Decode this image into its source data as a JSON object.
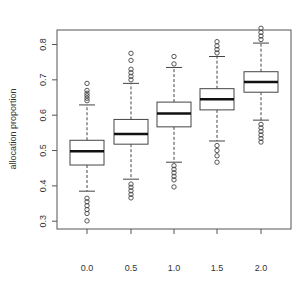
{
  "chart_data": {
    "type": "boxplot",
    "title": "",
    "xlabel": "",
    "ylabel": "allocation proportion",
    "categories": [
      "0.0",
      "0.5",
      "1.0",
      "1.5",
      "2.0"
    ],
    "ylim": [
      0.278,
      0.841
    ],
    "yticks": [
      0.3,
      0.4,
      0.5,
      0.6,
      0.7,
      0.8
    ],
    "ytick_labels": [
      "0.3",
      "0.4",
      "0.5",
      "0.6",
      "0.7",
      "0.8"
    ],
    "grid": false,
    "legend": null,
    "series": [
      {
        "name": "allocation proportion",
        "boxes": [
          {
            "category": "0.0",
            "whisker_low": 0.385,
            "q1": 0.459,
            "median": 0.498,
            "q3": 0.529,
            "whisker_high": 0.629,
            "outliers_high": [
              0.641,
              0.648,
              0.655,
              0.662,
              0.67,
              0.69
            ],
            "outliers_low": [
              0.301,
              0.322,
              0.333,
              0.344,
              0.355,
              0.365
            ]
          },
          {
            "category": "0.5",
            "whisker_low": 0.419,
            "q1": 0.518,
            "median": 0.547,
            "q3": 0.588,
            "whisker_high": 0.69,
            "outliers_high": [
              0.7,
              0.71,
              0.72,
              0.73,
              0.755,
              0.775
            ],
            "outliers_low": [
              0.366,
              0.376,
              0.386,
              0.396,
              0.405
            ]
          },
          {
            "category": "1.0",
            "whisker_low": 0.467,
            "q1": 0.567,
            "median": 0.605,
            "q3": 0.637,
            "whisker_high": 0.735,
            "outliers_high": [
              0.745,
              0.766
            ],
            "outliers_low": [
              0.397,
              0.417,
              0.427,
              0.437,
              0.447,
              0.457
            ]
          },
          {
            "category": "1.5",
            "whisker_low": 0.527,
            "q1": 0.615,
            "median": 0.645,
            "q3": 0.675,
            "whisker_high": 0.766,
            "outliers_high": [
              0.776,
              0.786,
              0.796,
              0.808
            ],
            "outliers_low": [
              0.467,
              0.485,
              0.5,
              0.514
            ]
          },
          {
            "category": "2.0",
            "whisker_low": 0.586,
            "q1": 0.665,
            "median": 0.694,
            "q3": 0.723,
            "whisker_high": 0.804,
            "outliers_high": [
              0.814,
              0.824,
              0.834,
              0.846
            ],
            "outliers_low": [
              0.524,
              0.534,
              0.544,
              0.554,
              0.564,
              0.574
            ]
          }
        ]
      }
    ]
  },
  "colors": {
    "frame": "#555555",
    "box_stroke": "#444444",
    "median": "#111111",
    "text": "#333333",
    "background": "#ffffff"
  }
}
